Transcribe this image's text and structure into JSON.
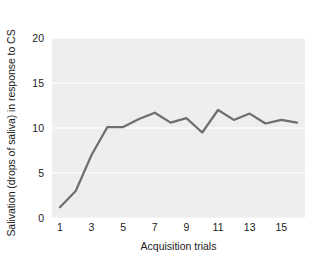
{
  "chart_data": {
    "type": "line",
    "title": "",
    "xlabel": "Acquisition trials",
    "ylabel": "Salivation (drops of saliva) in response to CS",
    "x": [
      1,
      2,
      3,
      4,
      5,
      6,
      7,
      8,
      9,
      10,
      11,
      12,
      13,
      14,
      15,
      16
    ],
    "values": [
      1.2,
      3.0,
      7.0,
      10.1,
      10.1,
      11.0,
      11.7,
      10.6,
      11.1,
      9.5,
      12.0,
      10.9,
      11.6,
      10.5,
      10.9,
      10.6
    ],
    "series": [
      {
        "name": "Salivation",
        "values": [
          1.2,
          3.0,
          7.0,
          10.1,
          10.1,
          11.0,
          11.7,
          10.6,
          11.1,
          9.5,
          12.0,
          10.9,
          11.6,
          10.5,
          10.9,
          10.6
        ]
      }
    ],
    "xlim": [
      0.5,
      16.5
    ],
    "ylim": [
      0,
      20
    ],
    "yticks": [
      0,
      5,
      10,
      15,
      20
    ],
    "ytick_labels": [
      "0",
      "5",
      "10",
      "15",
      "20"
    ],
    "xticks": [
      1,
      3,
      5,
      7,
      9,
      11,
      13,
      15
    ],
    "xtick_labels": [
      "1",
      "3",
      "5",
      "7",
      "9",
      "11",
      "13",
      "15"
    ],
    "grid": "horizontal",
    "legend": "none",
    "line_color": "#6e6e6e",
    "plot_background": "#eeeeee",
    "gridline_color": "#fafafa",
    "figure_background": "#ffffff",
    "text_color": "#1b1b1b"
  }
}
